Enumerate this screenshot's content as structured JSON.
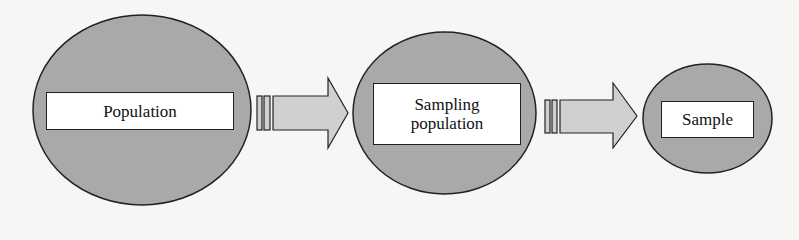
{
  "diagram": {
    "type": "flow",
    "colors": {
      "node_fill": "#a9a9a9",
      "arrow_fill": "#d0d0d0",
      "stroke": "#222222",
      "label_bg": "#ffffff"
    },
    "nodes": [
      {
        "id": "population",
        "label": "Population"
      },
      {
        "id": "sampling_population",
        "label_line1": "Sampling",
        "label_line2": "population"
      },
      {
        "id": "sample",
        "label": "Sample"
      }
    ],
    "edges": [
      {
        "from": "population",
        "to": "sampling_population",
        "icon": "arrow-right-icon"
      },
      {
        "from": "sampling_population",
        "to": "sample",
        "icon": "arrow-right-icon"
      }
    ]
  }
}
